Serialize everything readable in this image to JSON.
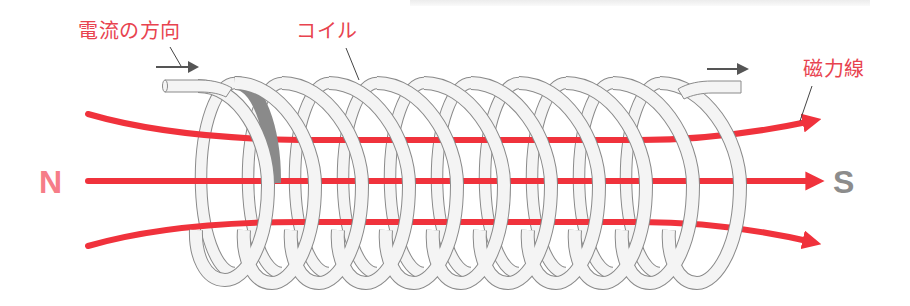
{
  "labels": {
    "current_direction": "電流の方向",
    "coil": "コイル",
    "field_lines": "磁力線",
    "north": "N",
    "south": "S"
  },
  "colors": {
    "label_red": "#e8434f",
    "field_line_red": "#f0323c",
    "north_pink": "#f67d88",
    "south_gray": "#8c8c8c",
    "coil_fill": "#f3f3f3",
    "coil_stroke": "#8a8a8a",
    "arrow_gray": "#555555"
  },
  "diagram": {
    "coil_turns": 10,
    "field_line_count": 3,
    "current_arrows": 2
  }
}
